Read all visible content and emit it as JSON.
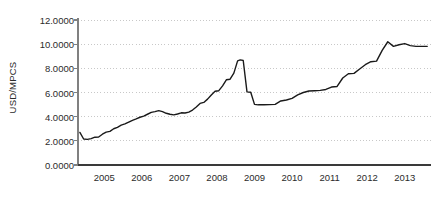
{
  "chart_data": {
    "type": "line",
    "title": "",
    "subtitle": "",
    "xlabel": "",
    "ylabel": "USD/MPCS",
    "ylim": [
      0.0,
      12.0
    ],
    "xlim": [
      2004.3,
      2013.7
    ],
    "grid": true,
    "grid_style": "dotted",
    "legend": "none",
    "y_ticks": [
      0.0,
      2.0,
      4.0,
      6.0,
      8.0,
      10.0,
      12.0
    ],
    "y_tick_labels": [
      "0.0000",
      "2.0000",
      "4.0000",
      "6.0000",
      "8.0000",
      "10.0000",
      "12.0000"
    ],
    "x_ticks": [
      2005,
      2006,
      2007,
      2008,
      2009,
      2010,
      2011,
      2012,
      2013
    ],
    "x_tick_labels": [
      "2005",
      "2006",
      "2007",
      "2008",
      "2009",
      "2010",
      "2011",
      "2012",
      "2013"
    ],
    "line_color": "#1a1a1a",
    "line_width": 1.4,
    "grid_color": "#c8c8c8",
    "axis_color": "#808080",
    "series": [
      {
        "name": "USD/MPCS",
        "x": [
          2004.35,
          2004.45,
          2004.55,
          2004.65,
          2004.75,
          2004.85,
          2004.95,
          2005.05,
          2005.15,
          2005.25,
          2005.35,
          2005.45,
          2005.55,
          2005.65,
          2005.75,
          2005.85,
          2005.95,
          2006.05,
          2006.15,
          2006.25,
          2006.35,
          2006.45,
          2006.55,
          2006.65,
          2006.75,
          2006.85,
          2006.95,
          2007.05,
          2007.15,
          2007.25,
          2007.35,
          2007.45,
          2007.55,
          2007.65,
          2007.75,
          2007.85,
          2007.95,
          2008.05,
          2008.15,
          2008.25,
          2008.35,
          2008.45,
          2008.55,
          2008.62,
          2008.7,
          2008.8,
          2008.9,
          2009.0,
          2009.1,
          2009.25,
          2009.4,
          2009.55,
          2009.7,
          2009.85,
          2010.0,
          2010.15,
          2010.3,
          2010.45,
          2010.6,
          2010.75,
          2010.9,
          2011.05,
          2011.2,
          2011.35,
          2011.5,
          2011.65,
          2011.8,
          2011.95,
          2012.1,
          2012.25,
          2012.4,
          2012.55,
          2012.7,
          2012.85,
          2013.0,
          2013.15,
          2013.3,
          2013.45,
          2013.6
        ],
        "values": [
          2.7,
          2.15,
          2.12,
          2.18,
          2.3,
          2.32,
          2.55,
          2.72,
          2.78,
          3.0,
          3.12,
          3.3,
          3.4,
          3.55,
          3.7,
          3.82,
          3.95,
          4.05,
          4.2,
          4.35,
          4.42,
          4.5,
          4.42,
          4.28,
          4.2,
          4.15,
          4.22,
          4.32,
          4.3,
          4.38,
          4.55,
          4.8,
          5.1,
          5.18,
          5.45,
          5.8,
          6.1,
          6.15,
          6.55,
          7.05,
          7.1,
          7.6,
          8.62,
          8.7,
          8.65,
          6.05,
          6.02,
          5.02,
          4.98,
          4.98,
          5.0,
          5.02,
          5.3,
          5.38,
          5.52,
          5.8,
          6.0,
          6.12,
          6.15,
          6.18,
          6.25,
          6.45,
          6.5,
          7.2,
          7.55,
          7.58,
          7.95,
          8.3,
          8.55,
          8.6,
          9.48,
          10.2,
          9.82,
          9.95,
          10.05,
          9.88,
          9.82,
          9.82,
          9.82
        ]
      }
    ]
  }
}
